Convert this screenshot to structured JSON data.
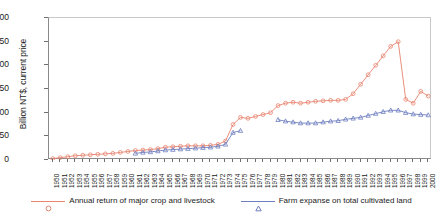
{
  "chart_data": {
    "type": "line",
    "title": "",
    "xlabel": "",
    "ylabel": "Billion NT$, current price",
    "ylim": [
      0,
      300
    ],
    "yticks": [
      0,
      50,
      100,
      150,
      200,
      250,
      300
    ],
    "grid": false,
    "legend_position": "bottom",
    "x": [
      1950,
      1951,
      1952,
      1953,
      1954,
      1955,
      1956,
      1957,
      1958,
      1959,
      1960,
      1961,
      1962,
      1963,
      1964,
      1965,
      1966,
      1967,
      1968,
      1969,
      1970,
      1971,
      1972,
      1973,
      1974,
      1975,
      1976,
      1977,
      1978,
      1979,
      1980,
      1981,
      1982,
      1983,
      1984,
      1985,
      1986,
      1987,
      1988,
      1989,
      1990,
      1991,
      1992,
      1993,
      1994,
      1995,
      1996,
      1997,
      1998,
      1999,
      2000
    ],
    "series": [
      {
        "name": "Annual return of major crop and livestock",
        "color": "#e8836e",
        "marker": "circle",
        "values": [
          3,
          5,
          7,
          9,
          10,
          11,
          12,
          13,
          14,
          16,
          18,
          20,
          21,
          22,
          24,
          27,
          28,
          29,
          30,
          30,
          30,
          31,
          33,
          40,
          75,
          90,
          88,
          92,
          96,
          100,
          115,
          120,
          122,
          120,
          122,
          124,
          125,
          126,
          126,
          128,
          140,
          160,
          180,
          200,
          220,
          240,
          250,
          128,
          120,
          145,
          135
        ]
      },
      {
        "name": "Farm expanse on total cultivated land",
        "color": "#6f7fc0",
        "marker": "triangle",
        "values": [
          null,
          null,
          null,
          null,
          null,
          null,
          null,
          null,
          null,
          null,
          null,
          14,
          16,
          17,
          19,
          21,
          22,
          23,
          24,
          25,
          26,
          27,
          29,
          33,
          58,
          62,
          null,
          null,
          null,
          null,
          85,
          82,
          80,
          78,
          78,
          78,
          80,
          82,
          83,
          86,
          88,
          90,
          94,
          98,
          102,
          105,
          105,
          100,
          97,
          96,
          95
        ]
      }
    ]
  },
  "legend": {
    "entries": [
      {
        "label": "Annual return of major crop and livestock"
      },
      {
        "label": "Farm expanse on total cultivated land"
      }
    ]
  },
  "axes": {
    "y_title": "Billion NT$, current price"
  }
}
